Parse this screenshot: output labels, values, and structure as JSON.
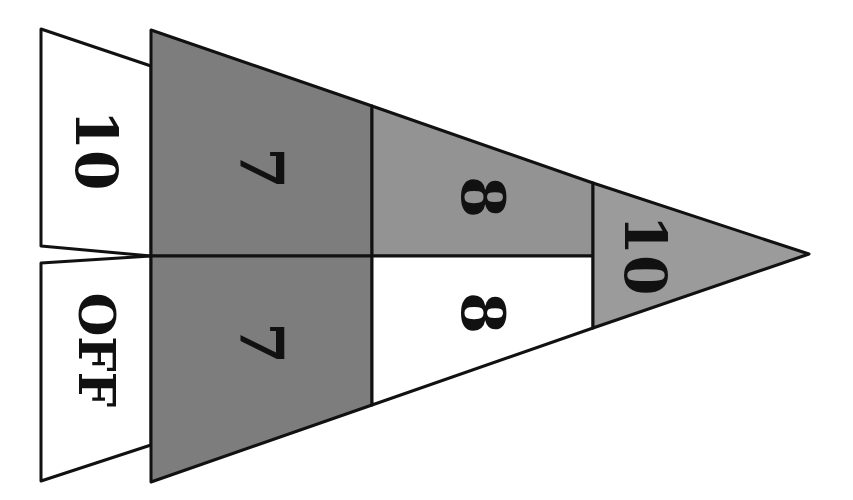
{
  "diagram": {
    "type": "pennant-scoring-board",
    "orientation": "rotated-90-clockwise",
    "colors": {
      "outline": "#111111",
      "dark_gray": "#7d7d7d",
      "mid_gray": "#939393",
      "light_gray": "#9b9b9b",
      "white": "#ffffff"
    },
    "sections": [
      {
        "id": "ten-left",
        "label": "10",
        "fill": "white"
      },
      {
        "id": "off",
        "label": "OFF",
        "fill": "white"
      },
      {
        "id": "seven-top",
        "label": "7",
        "fill": "dark_gray"
      },
      {
        "id": "seven-bottom",
        "label": "7",
        "fill": "dark_gray"
      },
      {
        "id": "eight-top",
        "label": "8",
        "fill": "mid_gray"
      },
      {
        "id": "eight-bottom",
        "label": "8",
        "fill": "white"
      },
      {
        "id": "ten-tip",
        "label": "10",
        "fill": "light_gray"
      }
    ]
  }
}
